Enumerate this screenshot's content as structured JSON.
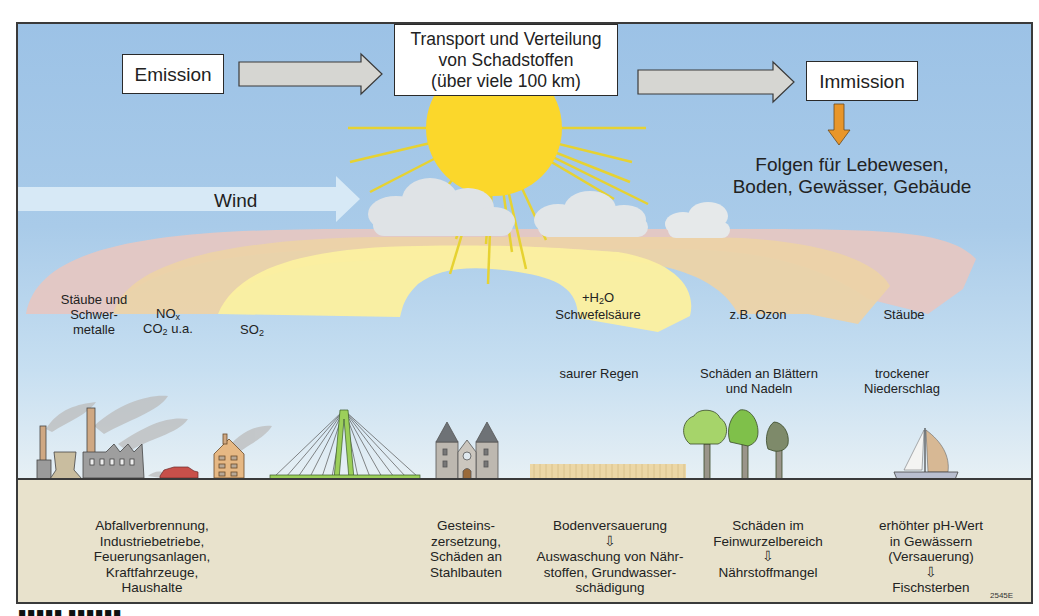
{
  "flow": {
    "emission": "Emission",
    "transport": "Transport und Verteilung\nvon Schadstoffen\n(über viele 100 km)",
    "immission": "Immission",
    "consequences": "Folgen für Lebewesen,\nBoden, Gewässer, Gebäude"
  },
  "wind_label": "Wind",
  "plume_labels": {
    "dust_metals": "Stäube und\nSchwer-\nmetalle",
    "nox_co2_top": "NOx",
    "nox_co2_bottom": "CO2 u.a.",
    "so2": "SO2",
    "h2o_top": "+H2O",
    "sulfuric_acid": "Schwefelsäure",
    "ozone": "z.B. Ozon",
    "dust": "Stäube"
  },
  "effects_air": {
    "acid_rain": "saurer Regen",
    "leaf_damage": "Schäden an Blättern\nund Nadeln",
    "dry_deposition": "trockener\nNiederschlag"
  },
  "ground_labels": {
    "sources": "Abfallverbrennung,\nIndustriebetriebe,\nFeuerungsanlagen,\nKraftfahrzeuge,\nHaushalte",
    "buildings": "Gesteins-\nzersetzung,\nSchäden an\nStahlbauten",
    "soil": "Bodenversauerung\n⇩\nAuswaschung von Nähr-\nstoffen, Grundwasser-\nschädigung",
    "roots": "Schäden im\nFeinwurzelbereich\n⇩\nNährstoffmangel",
    "water": "erhöhter pH-Wert\nin Gewässern\n(Versauerung)\n⇩\nFischsterben"
  },
  "figure_code": "2545E",
  "colors": {
    "sky_top": "#9cc2e6",
    "sun": "#fbd72b",
    "plume_dust": "#e5c7c3",
    "plume_nox": "#ecd3a8",
    "plume_so2": "#fbf0a0",
    "ground": "#e8e2cc",
    "arrow_orange": "#e8962a",
    "arrow_grey": "#d6d6d2"
  },
  "icons": [
    "flow-arrow-icon",
    "sun-icon",
    "cloud-icon",
    "wind-arrow-icon",
    "factory-icon",
    "power-plant-icon",
    "car-icon",
    "house-icon",
    "bridge-icon",
    "church-icon",
    "field-icon",
    "tree-icon",
    "sailboat-icon",
    "down-arrow-icon"
  ]
}
